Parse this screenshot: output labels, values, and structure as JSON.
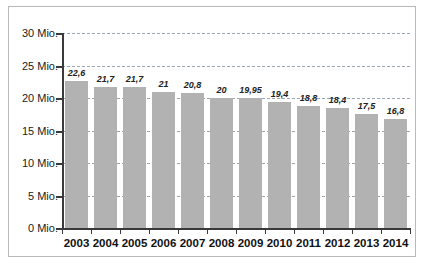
{
  "chart_data": {
    "type": "bar",
    "title": "",
    "xlabel": "",
    "ylabel": "",
    "categories": [
      "2003",
      "2004",
      "2005",
      "2006",
      "2007",
      "2008",
      "2009",
      "2010",
      "2011",
      "2012",
      "2013",
      "2014"
    ],
    "values": [
      22.6,
      21.7,
      21.7,
      21,
      20.8,
      20,
      19.95,
      19.4,
      18.8,
      18.4,
      17.5,
      16.8
    ],
    "value_labels": [
      "22,6",
      "21,7",
      "21,7",
      "21",
      "20,8",
      "20",
      "19,95",
      "19,4",
      "18,8",
      "18,4",
      "17,5",
      "16,8"
    ],
    "ylim": [
      0,
      30
    ],
    "yticks": [
      0,
      5,
      10,
      15,
      20,
      25,
      30
    ],
    "ytick_labels": [
      "0 Mio.",
      "5 Mio.",
      "10 Mio.",
      "15 Mio.",
      "20 Mio.",
      "25 Mio.",
      "30 Mio."
    ],
    "grid": true,
    "legend": null,
    "bar_color": "#b2b2b2",
    "gridline_color": "#9aa6b4",
    "axis_color": "#3a3a3a",
    "frame_color": "#b9b9b9"
  }
}
